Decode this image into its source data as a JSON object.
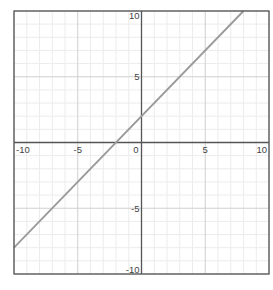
{
  "chart_data": {
    "type": "line",
    "title": "",
    "xlabel": "",
    "ylabel": "",
    "xlim": [
      -10,
      10
    ],
    "ylim": [
      -10,
      10
    ],
    "grid": true,
    "minor_grid": true,
    "major_tick_step": 5,
    "minor_tick_step": 1,
    "x_tick_labels": [
      "-10",
      "-5",
      "0",
      "5",
      "10"
    ],
    "y_tick_labels": [
      "10",
      "5",
      "-5",
      "-10"
    ],
    "series": [
      {
        "name": "y = x + 2",
        "equation": "y = x + 2",
        "slope": 1,
        "intercept": 2,
        "x": [
          -10,
          8
        ],
        "y": [
          -8,
          10
        ],
        "color": "#9a9a9a"
      }
    ]
  },
  "colors": {
    "frame": "#555555",
    "axis": "#555555",
    "major_grid": "#cfcfcf",
    "minor_grid": "#ececec",
    "line": "#9a9a9a",
    "label": "#444444"
  }
}
